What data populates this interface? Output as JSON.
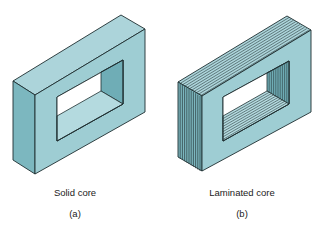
{
  "figures": [
    {
      "id": "a",
      "caption": "Solid core",
      "sublabel": "(a)",
      "caption_pos": [
        75,
        187
      ],
      "sublabel_pos": [
        75,
        208
      ]
    },
    {
      "id": "b",
      "caption": "Laminated core",
      "sublabel": "(b)",
      "caption_pos": [
        242,
        187
      ],
      "sublabel_pos": [
        242,
        208
      ]
    }
  ],
  "colors": {
    "top_face": "#acd4da",
    "side_face": "#7cb7bf",
    "front_face": "#9ecdd3",
    "inner_wall": "#6fadb6",
    "inner_floor": "#b4dadf",
    "outline": "#1e2e30",
    "lamination": "#2a3a3c"
  }
}
